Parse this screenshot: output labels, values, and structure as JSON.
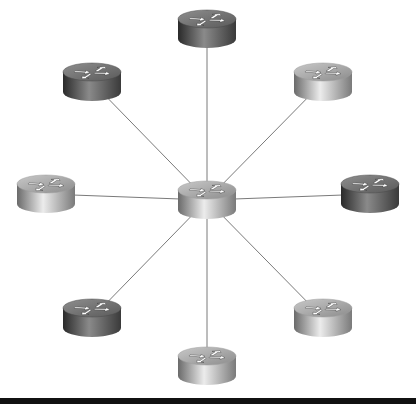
{
  "diagram": {
    "title": "",
    "topology": "star",
    "hub": "center",
    "colors": {
      "background": "#ffffff",
      "link": "#7a7a7a",
      "bottom_bar": "#111111",
      "dark_router": [
        "#2a2a2a",
        "#8a8a8a",
        "#3a3a3a"
      ],
      "light_router": [
        "#6a6a6a",
        "#e8e8e8",
        "#7a7a7a"
      ]
    },
    "router_size": {
      "w": 58,
      "h": 38
    },
    "nodes": [
      {
        "id": "center",
        "icon": "router-icon",
        "x": 207,
        "y": 200,
        "shade": "light"
      },
      {
        "id": "top",
        "icon": "router-icon",
        "x": 207,
        "y": 29,
        "shade": "dark"
      },
      {
        "id": "top-left",
        "icon": "router-icon",
        "x": 92,
        "y": 82,
        "shade": "dark"
      },
      {
        "id": "top-right",
        "icon": "router-icon",
        "x": 323,
        "y": 82,
        "shade": "light"
      },
      {
        "id": "left",
        "icon": "router-icon",
        "x": 46,
        "y": 194,
        "shade": "light"
      },
      {
        "id": "right",
        "icon": "router-icon",
        "x": 370,
        "y": 194,
        "shade": "dark"
      },
      {
        "id": "bottom-left",
        "icon": "router-icon",
        "x": 92,
        "y": 318,
        "shade": "dark"
      },
      {
        "id": "bottom-right",
        "icon": "router-icon",
        "x": 323,
        "y": 318,
        "shade": "light"
      },
      {
        "id": "bottom",
        "icon": "router-icon",
        "x": 207,
        "y": 366,
        "shade": "light"
      }
    ],
    "links": [
      [
        "center",
        "top"
      ],
      [
        "center",
        "top-left"
      ],
      [
        "center",
        "top-right"
      ],
      [
        "center",
        "left"
      ],
      [
        "center",
        "right"
      ],
      [
        "center",
        "bottom-left"
      ],
      [
        "center",
        "bottom-right"
      ],
      [
        "center",
        "bottom"
      ]
    ]
  }
}
